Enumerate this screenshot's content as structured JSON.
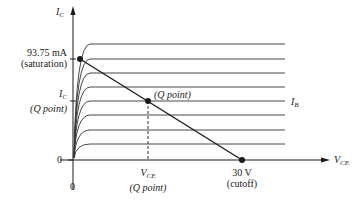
{
  "diagram": {
    "type": "transistor output characteristics with DC load line",
    "y_axis": {
      "label_main": "I",
      "label_sub": "C"
    },
    "x_axis": {
      "label_main": "V",
      "label_sub": "CE"
    },
    "origin": {
      "x_label": "0",
      "y_label": "0"
    },
    "saturation": {
      "value": "93.75 mA",
      "note": "(saturation)"
    },
    "ic_q": {
      "label_main": "I",
      "label_sub": "C",
      "note": "(Q point)"
    },
    "vce_q": {
      "label_main": "V",
      "label_sub": "CE",
      "note": "(Q point)"
    },
    "q_point_label": "(Q point)",
    "cutoff": {
      "value": "30 V",
      "note": "(cutoff)"
    },
    "ib_label": {
      "label_main": "I",
      "label_sub": "B"
    },
    "curve_count": 9,
    "colors": {
      "line": "#1a1a1a",
      "curve": "#333333",
      "background": "#ffffff"
    }
  }
}
